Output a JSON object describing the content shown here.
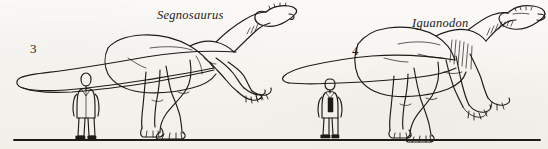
{
  "plate": {
    "background_color": "#f7f5f1",
    "ink_color": "#1d1a17",
    "width": 548,
    "height": 149,
    "description": "Line-art scale comparison of two dinosaurs with human figures"
  },
  "ground": {
    "name": "ground-line",
    "color": "#1d1a17"
  },
  "figures": [
    {
      "number": "3",
      "species": "Segnosaurus",
      "scale_human": "man-silhouette",
      "posture": "quadrupedal-leaning, long neck raised, small head, long tapering tail"
    },
    {
      "number": "4",
      "species": "Iguanodon",
      "scale_human": "man-silhouette",
      "posture": "quadrupedal-leaning, deep body, beaked head, long straight tail"
    }
  ]
}
